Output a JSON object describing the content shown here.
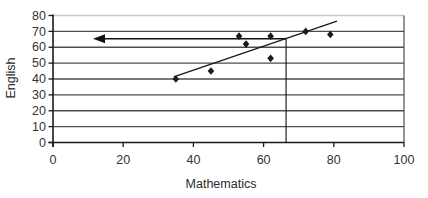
{
  "chart_data": {
    "type": "scatter",
    "title": "",
    "xlabel": "Mathematics",
    "ylabel": "English",
    "xlim": [
      0,
      100
    ],
    "ylim": [
      0,
      80
    ],
    "x_ticks": [
      0,
      20,
      40,
      60,
      80,
      100
    ],
    "y_ticks": [
      0,
      10,
      20,
      30,
      40,
      50,
      60,
      70,
      80
    ],
    "grid": "horizontal-only",
    "legend": "none",
    "points": [
      {
        "x": 35,
        "y": 40
      },
      {
        "x": 45,
        "y": 45
      },
      {
        "x": 53,
        "y": 67
      },
      {
        "x": 55,
        "y": 62
      },
      {
        "x": 62,
        "y": 67
      },
      {
        "x": 62,
        "y": 53
      },
      {
        "x": 72,
        "y": 70
      },
      {
        "x": 79,
        "y": 68
      }
    ],
    "trendline": {
      "x1": 34.4,
      "y1": 41.3,
      "x2": 80.9,
      "y2": 76.5
    },
    "annotation": {
      "vertical_line_x": 66.4,
      "vertical_line_y_top": 65.4,
      "arrow_y": 65.3,
      "arrow_from_x": 66.4,
      "arrow_tip_x": 11.4
    },
    "colors": {
      "marker": "#1a1a1a",
      "trend_line": "#1a1a1a",
      "grid_line": "#4d4d4d",
      "top_grid_line": "#c8c8c8",
      "axis": "#1a1a1a",
      "tick_label": "#333333",
      "annotation": "#111111",
      "background": "#ffffff"
    }
  }
}
